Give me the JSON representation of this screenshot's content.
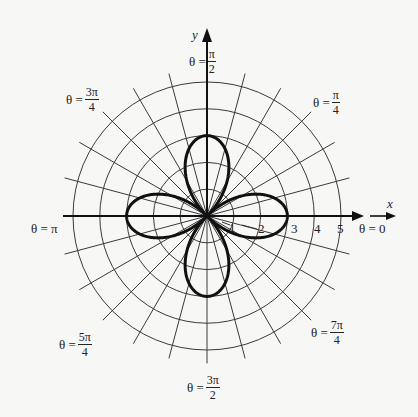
{
  "chart_data": {
    "type": "polar",
    "title": "",
    "equation_depicted": "r = 3cos(2θ)",
    "curve": {
      "kind": "four-leaved rose",
      "amplitude": 3,
      "k": 2,
      "petal_directions": [
        "θ = 0",
        "θ = π/2",
        "θ = π",
        "θ = 3π/2"
      ],
      "petal_length": 3
    },
    "grid": {
      "circles_r": [
        1,
        2,
        3,
        4,
        5
      ],
      "radial_line_step_degrees": 15,
      "radial_extent_r": 5.5
    },
    "axes": {
      "x_label": "x",
      "y_label": "y"
    },
    "r_tick_labels": [
      "1",
      "2",
      "3",
      "4",
      "5"
    ],
    "angle_labels": [
      {
        "id": "0",
        "prefix": "θ = ",
        "text": "0"
      },
      {
        "id": "pi_4",
        "prefix": "θ = ",
        "num": "π",
        "den": "4"
      },
      {
        "id": "pi_2",
        "prefix": "θ = ",
        "num": "π",
        "den": "2"
      },
      {
        "id": "3pi_4",
        "prefix": "θ = ",
        "num": "3π",
        "den": "4"
      },
      {
        "id": "pi",
        "prefix": "θ = ",
        "text": "π"
      },
      {
        "id": "5pi_4",
        "prefix": "θ = ",
        "num": "5π",
        "den": "4"
      },
      {
        "id": "3pi_2",
        "prefix": "θ = ",
        "num": "3π",
        "den": "2"
      },
      {
        "id": "7pi_4",
        "prefix": "θ = ",
        "num": "7π",
        "den": "4"
      }
    ],
    "colors": {
      "grid": "#3a3a3a",
      "curve": "#111111",
      "background": "#f7f7f5"
    }
  }
}
